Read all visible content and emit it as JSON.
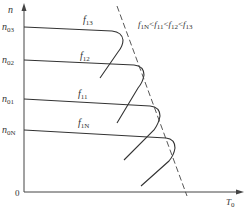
{
  "diagram": {
    "type": "mechanical characteristic curves",
    "y_axis": {
      "label": "n",
      "origin_label": "0"
    },
    "x_axis": {
      "label": "T",
      "label_sub": "0"
    },
    "y_ticks": [
      {
        "label": "n",
        "sub": "03",
        "y": 27
      },
      {
        "label": "n",
        "sub": "02",
        "y": 60
      },
      {
        "label": "n",
        "sub": "01",
        "y": 99
      },
      {
        "label": "n",
        "sub": "0N",
        "y": 130
      }
    ],
    "curves": [
      {
        "label": "f",
        "sub": "13"
      },
      {
        "label": "f",
        "sub": "12"
      },
      {
        "label": "f",
        "sub": "11"
      },
      {
        "label": "f",
        "sub": "1N"
      }
    ],
    "relation": {
      "parts": [
        {
          "label": "f",
          "sub": "1N"
        },
        {
          "op": "<"
        },
        {
          "label": "f",
          "sub": "11"
        },
        {
          "op": "<"
        },
        {
          "label": "f",
          "sub": "12"
        },
        {
          "op": "<"
        },
        {
          "label": "f",
          "sub": "13"
        }
      ]
    },
    "line_color": "#333333"
  }
}
